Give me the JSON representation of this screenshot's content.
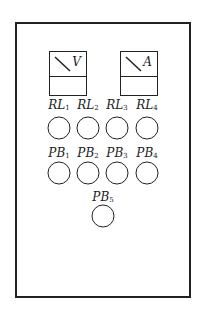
{
  "panel": {
    "meters": [
      {
        "symbol": "V",
        "icon": "voltmeter-icon"
      },
      {
        "symbol": "A",
        "icon": "ammeter-icon"
      }
    ],
    "relays": [
      {
        "prefix": "RL",
        "sub": "1"
      },
      {
        "prefix": "RL",
        "sub": "2"
      },
      {
        "prefix": "RL",
        "sub": "3"
      },
      {
        "prefix": "RL",
        "sub": "4"
      }
    ],
    "push_buttons": [
      {
        "prefix": "PB",
        "sub": "1"
      },
      {
        "prefix": "PB",
        "sub": "2"
      },
      {
        "prefix": "PB",
        "sub": "3"
      },
      {
        "prefix": "PB",
        "sub": "4"
      },
      {
        "prefix": "PB",
        "sub": "5"
      }
    ]
  }
}
